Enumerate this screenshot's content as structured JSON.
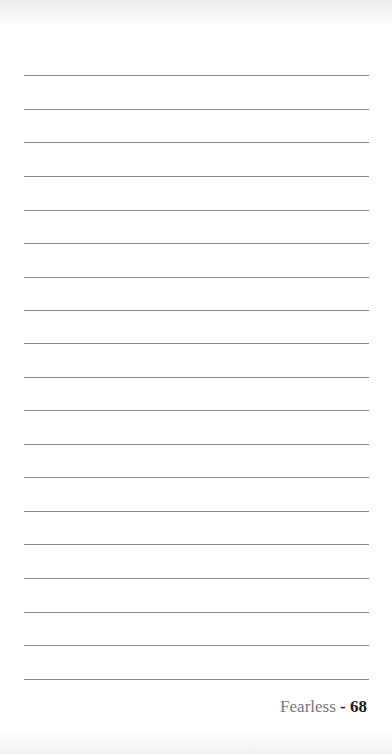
{
  "page": {
    "type": "lined-notes-page",
    "line_count": 19,
    "line_color": "#8a8a8a",
    "background_color": "#ffffff"
  },
  "footer": {
    "title": "Fearless",
    "separator": " - ",
    "page_number": "68"
  }
}
